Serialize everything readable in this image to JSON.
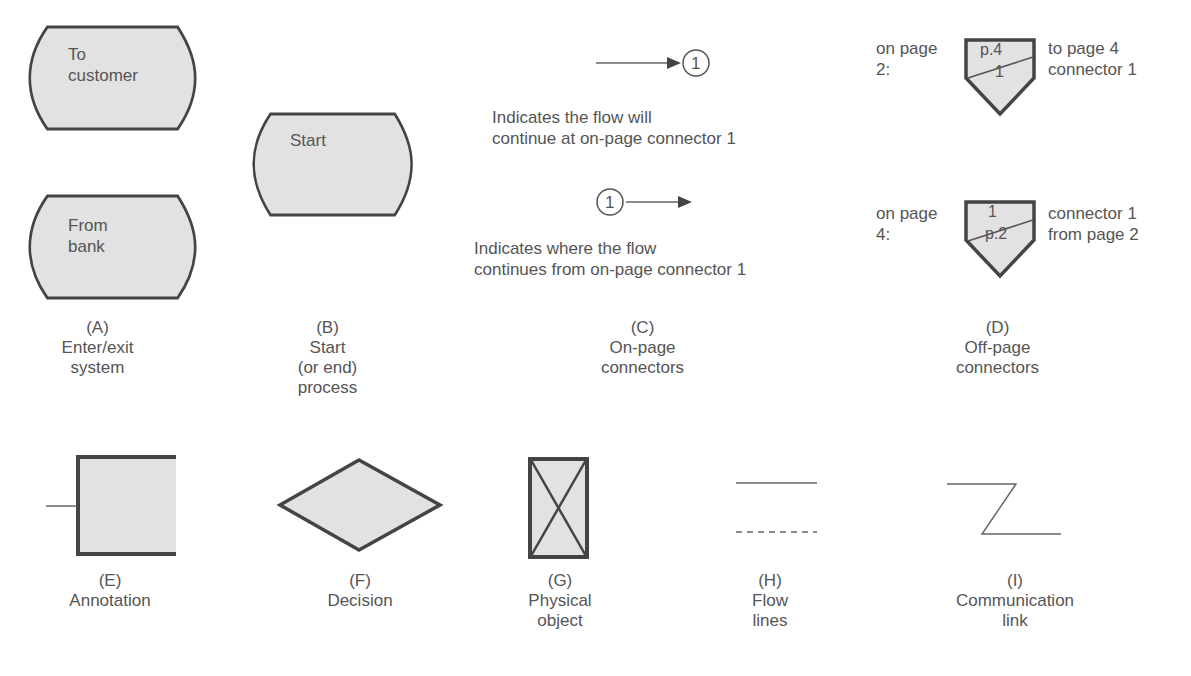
{
  "colors": {
    "fill": "#e2e2e2",
    "stroke": "#444444",
    "text": "#555555",
    "line": "#666666"
  },
  "symbols": {
    "A": {
      "letter": "(A)",
      "caption": [
        "Enter/exit",
        "system"
      ],
      "shapes": [
        {
          "label": [
            "To",
            "customer"
          ]
        },
        {
          "label": [
            "From",
            "bank"
          ]
        }
      ]
    },
    "B": {
      "letter": "(B)",
      "caption": [
        "Start",
        "(or end)",
        "process"
      ],
      "shape_label": "Start"
    },
    "C": {
      "letter": "(C)",
      "caption": [
        "On-page",
        "connectors"
      ],
      "connector_number": "1",
      "desc_top": [
        "Indicates the flow will",
        "continue at on-page connector 1"
      ],
      "desc_bottom": [
        "Indicates where the flow",
        "continues from on-page connector 1"
      ]
    },
    "D": {
      "letter": "(D)",
      "caption": [
        "Off-page",
        "connectors"
      ],
      "top": {
        "left": [
          "on page",
          "2:"
        ],
        "upper": "p.4",
        "lower": "1",
        "right": [
          "to page 4",
          "connector 1"
        ]
      },
      "bottom": {
        "left": [
          "on page",
          "4:"
        ],
        "upper": "1",
        "lower": "p.2",
        "right": [
          "connector 1",
          "from page 2"
        ]
      }
    },
    "E": {
      "letter": "(E)",
      "caption": [
        "Annotation"
      ]
    },
    "F": {
      "letter": "(F)",
      "caption": [
        "Decision"
      ]
    },
    "G": {
      "letter": "(G)",
      "caption": [
        "Physical",
        "object"
      ]
    },
    "H": {
      "letter": "(H)",
      "caption": [
        "Flow",
        "lines"
      ]
    },
    "I": {
      "letter": "(I)",
      "caption": [
        "Communication",
        "link"
      ]
    }
  }
}
